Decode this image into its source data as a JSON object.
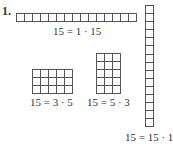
{
  "problem_number": "1.",
  "figures": [
    {
      "id": "1x15",
      "rows": 1,
      "cols": 15,
      "label": "15 = 1 · 15"
    },
    {
      "id": "3x5",
      "rows": 3,
      "cols": 5,
      "label": "15 = 3 · 5"
    },
    {
      "id": "5x3",
      "rows": 5,
      "cols": 3,
      "label": "15 = 5 · 3"
    },
    {
      "id": "15x1",
      "rows": 15,
      "cols": 1,
      "label": "15 = 15 · 1"
    }
  ]
}
